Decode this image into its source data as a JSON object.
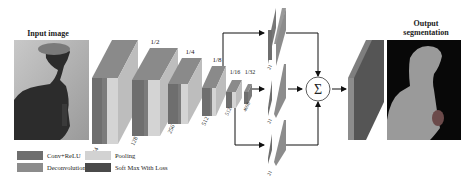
{
  "diagram": {
    "title_input": "Input image",
    "title_output_line1": "Output",
    "title_output_line2": "segmentation",
    "scale_labels": [
      "1/2",
      "1/4",
      "1/8",
      "1/16",
      "1/32"
    ],
    "channel_labels": [
      "64",
      "128",
      "256",
      "512",
      "512",
      "4096"
    ],
    "branch_labels": [
      "21",
      "21",
      "21"
    ],
    "sum_symbol": "Σ",
    "colors": {
      "conv_relu": "#6e6e6e",
      "pooling": "#d2d2d2",
      "deconvolution": "#8c8c8c",
      "softmax": "#4a4a4a"
    }
  },
  "legend": {
    "items": [
      {
        "label": "Conv+ReLU",
        "color": "#6e6e6e"
      },
      {
        "label": "Pooling",
        "color": "#d2d2d2"
      },
      {
        "label": "Deconvolution",
        "color": "#8c8c8c"
      },
      {
        "label": "Soft Max With Loss",
        "color": "#4a4a4a"
      }
    ]
  }
}
